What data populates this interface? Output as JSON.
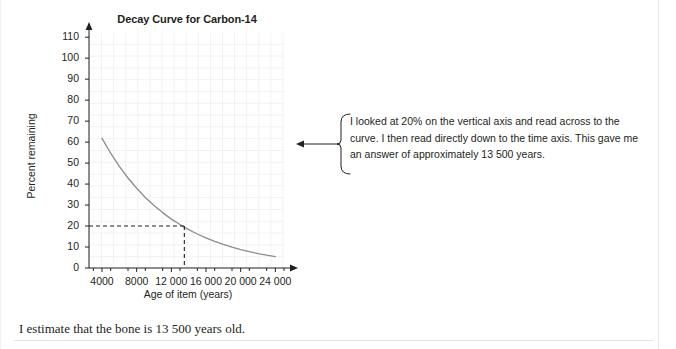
{
  "chart_data": {
    "type": "line",
    "title": "Decay Curve for Carbon-14",
    "xlabel": "Age of item (years)",
    "ylabel": "Percent remaining",
    "xlim": [
      2500,
      25000
    ],
    "ylim": [
      0,
      112
    ],
    "grid": true,
    "legend": "none",
    "x_ticks": [
      "4000",
      "8000",
      "12 000",
      "16 000",
      "20 000",
      "24 000"
    ],
    "x_tick_values": [
      4000,
      8000,
      12000,
      16000,
      20000,
      24000
    ],
    "y_ticks": [
      "0",
      "10",
      "20",
      "30",
      "40",
      "50",
      "60",
      "70",
      "80",
      "90",
      "100",
      "110"
    ],
    "y_tick_values": [
      0,
      10,
      20,
      30,
      40,
      50,
      60,
      70,
      80,
      90,
      100,
      110
    ],
    "series": [
      {
        "name": "Carbon-14 remaining",
        "color": "#8c8c8c",
        "x": [
          4000,
          5000,
          6000,
          7000,
          8000,
          9000,
          10000,
          11000,
          12000,
          13000,
          13500,
          14000,
          15000,
          16000,
          17000,
          18000,
          19000,
          20000,
          21000,
          22000,
          23000,
          24000
        ],
        "values": [
          61.8,
          54.7,
          48.4,
          42.9,
          38.0,
          33.6,
          29.8,
          26.4,
          23.3,
          20.7,
          19.5,
          18.3,
          16.2,
          14.4,
          12.7,
          11.3,
          10.0,
          8.8,
          7.8,
          6.9,
          6.1,
          5.4
        ]
      }
    ],
    "annotations": [
      {
        "name": "read-off-lines",
        "type": "dashed-guide",
        "from_y": 20,
        "to_x": 13500,
        "label": "20% remaining at approximately 13 500 years"
      }
    ]
  },
  "callout": {
    "text": "I looked at 20% on the vertical axis and read across to the curve. I then read directly down to the time axis. This gave me an answer of approximately 13 500 years."
  },
  "bottom": {
    "sentence": "I estimate that the bone is 13 500 years old."
  },
  "colors": {
    "curve": "#8c8c8c",
    "axis": "#231f20",
    "grid": "#f0f1f3",
    "text": "#231f20",
    "guide": "#231f20"
  }
}
